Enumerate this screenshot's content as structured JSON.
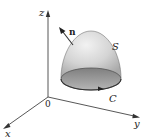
{
  "figure": {
    "axes": {
      "x_label": "x",
      "y_label": "y",
      "z_label": "z",
      "origin_label": "0"
    },
    "surface": {
      "label": "S",
      "fill_color": "#d9d9d9",
      "base_color": "#9a9a9a"
    },
    "normal_vector": {
      "label": "n"
    },
    "boundary_curve": {
      "label": "C"
    },
    "colors": {
      "axis": "#444444",
      "text": "#222222"
    }
  }
}
